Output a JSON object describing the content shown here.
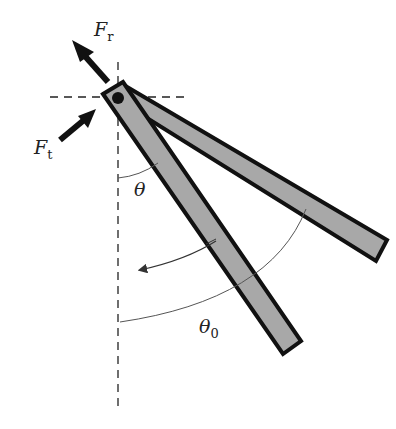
{
  "diagram": {
    "type": "pendulum-rod",
    "labels": {
      "radial_force": {
        "symbol": "F",
        "subscript": "r"
      },
      "tangential_force": {
        "symbol": "F",
        "subscript": "t"
      },
      "angle": {
        "symbol": "θ"
      },
      "initial_angle": {
        "symbol": "θ",
        "subscript": "0"
      }
    },
    "colors": {
      "rod_fill": "#a8a8a8",
      "outline": "#111111",
      "arc": "#555555"
    }
  }
}
